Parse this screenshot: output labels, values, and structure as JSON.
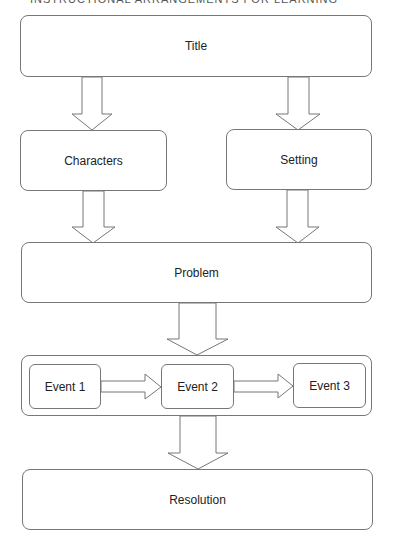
{
  "header": {
    "text": "INSTRUCTIONAL ARRANGEMENTS FOR LEARNING"
  },
  "diagram": {
    "title": "Title",
    "characters": "Characters",
    "setting": "Setting",
    "problem": "Problem",
    "events": [
      {
        "label": "Event 1"
      },
      {
        "label": "Event 2"
      },
      {
        "label": "Event 3"
      }
    ],
    "resolution": "Resolution"
  },
  "colors": {
    "stroke": "#777777",
    "fill": "#ffffff",
    "text": "#222222"
  }
}
